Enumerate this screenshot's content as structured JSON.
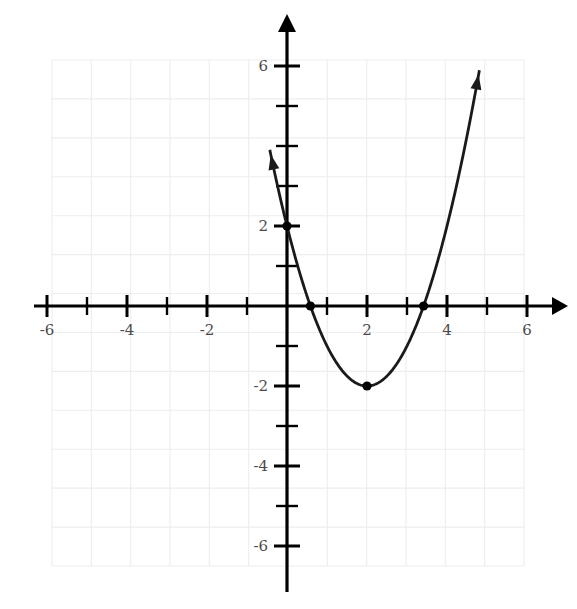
{
  "chart_data": {
    "type": "line",
    "title": "",
    "subtitle": "",
    "xlabel": "",
    "ylabel": "",
    "xlim": [
      -6.3,
      6.8
    ],
    "ylim": [
      -6.9,
      6.6
    ],
    "grid": true,
    "grid_color": "#ededf2",
    "grid_step": 1,
    "legend": "none",
    "axis_color": "#000000",
    "curve_color": "#1a1a1a",
    "point_color": "#000000",
    "x_ticks_major": [
      -6,
      -4,
      -2,
      2,
      4,
      6
    ],
    "x_ticks_minor": [
      -5,
      -3,
      -1,
      1,
      3,
      5
    ],
    "y_ticks_major": [
      6,
      2,
      -2,
      -4,
      -6
    ],
    "y_ticks_minor": [
      5,
      4,
      3,
      1,
      -1,
      -3,
      -5
    ],
    "x_tick_labels": [
      "-6",
      "-4",
      "-2",
      "2",
      "4",
      "6"
    ],
    "y_tick_labels": [
      "6",
      "2",
      "-2",
      "-4",
      "-6"
    ],
    "hidden_y_label_note": "label for y=4 is obscured by the curve",
    "series": [
      {
        "name": "parabola",
        "equation": "y = (x - 2)^2 - 2",
        "vertex": [
          2,
          -2
        ],
        "opens": "up",
        "leading_coefficient": 1,
        "domain_drawn": [
          -0.45,
          4.83
        ],
        "arrowheads": [
          "start",
          "end"
        ],
        "x": [
          -0.45,
          0.0,
          0.586,
          1.0,
          1.5,
          2.0,
          2.5,
          3.0,
          3.414,
          4.0,
          4.5,
          4.83
        ],
        "y": [
          4.0,
          2.0,
          0.0,
          -1.0,
          -1.75,
          -2.0,
          -1.75,
          -1.0,
          0.0,
          2.0,
          4.25,
          6.0
        ]
      }
    ],
    "marked_points": [
      {
        "label": "y-intercept",
        "x": 0,
        "y": 2
      },
      {
        "label": "x-intercept-left",
        "x": 0.586,
        "y": 0
      },
      {
        "label": "vertex",
        "x": 2,
        "y": -2
      },
      {
        "label": "x-intercept-right",
        "x": 3.414,
        "y": 0
      }
    ],
    "axes": {
      "x_axis": {
        "arrow": "right-only",
        "from": -6.35,
        "to": 6.85
      },
      "y_axis": {
        "arrow": "up-only",
        "from": -6.95,
        "to": 6.6
      }
    }
  }
}
